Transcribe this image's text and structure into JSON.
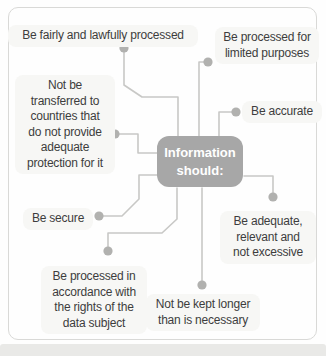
{
  "figure": {
    "center": {
      "label": "Information\nshould:"
    },
    "nodes": [
      {
        "id": "fairly-lawfully",
        "label": "Be fairly and lawfully processed"
      },
      {
        "id": "limited-purposes",
        "label": "Be processed for\nlimited purposes"
      },
      {
        "id": "not-transferred",
        "label": "Not be\ntransferred to\ncountries that\ndo not provide\nadequate\nprotection for it"
      },
      {
        "id": "accurate",
        "label": "Be accurate"
      },
      {
        "id": "secure",
        "label": "Be secure"
      },
      {
        "id": "adequate-relevant",
        "label": "Be adequate,\nrelevant and\nnot excessive"
      },
      {
        "id": "rights-data-subject",
        "label": "Be processed in\naccordance with\nthe rights of the\ndata subject"
      },
      {
        "id": "not-kept-longer",
        "label": "Not be kept longer\nthan is necessary"
      }
    ],
    "colors": {
      "center_box": "#a7a7a7",
      "center_text": "#ffffff",
      "connector": "#c8c8c6",
      "dot": "#b1b1af",
      "label_text": "#3d3d3d",
      "label_bg": "#f7f7f5",
      "frame_border": "#d9d9d7",
      "bottom_band": "#e9e9e7",
      "background": "#fefefe"
    }
  }
}
